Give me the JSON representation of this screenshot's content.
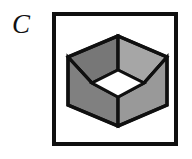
{
  "figure": {
    "label": "C",
    "caption_position": "left-of-frame",
    "frame": {
      "x": 52,
      "y": 12,
      "width": 126,
      "height": 134,
      "border_width": 4,
      "border_color": "#101010",
      "fill_color": "#ffffff"
    },
    "background_color": "#ffffff",
    "ink_color": "#101010"
  },
  "shape": {
    "name": "hexagonal-cube-with-square-hole",
    "description": "Isometric cube seen corner-on, forming a hexagon outline, with a square hole bored through it producing a white diamond opening at the center.",
    "outline_color": "#101010",
    "outline_width": 3,
    "hole_fill": "#ffffff",
    "vertices": {
      "top": [
        66,
        24
      ],
      "upper_left": [
        16,
        45
      ],
      "lower_left": [
        16,
        93
      ],
      "bottom": [
        66,
        114
      ],
      "lower_right": [
        115,
        93
      ],
      "upper_right": [
        115,
        45
      ]
    },
    "hole_vertices": {
      "top": [
        66,
        58
      ],
      "left": [
        40,
        71
      ],
      "bottom": [
        66,
        85
      ],
      "right": [
        92,
        71
      ]
    },
    "faces": [
      {
        "name": "top-left-facet",
        "color": "#777777"
      },
      {
        "name": "top-right-facet",
        "color": "#a6a6a6"
      },
      {
        "name": "left-facet",
        "color": "#808080"
      },
      {
        "name": "right-facet",
        "color": "#999999"
      },
      {
        "name": "hole-opening",
        "color": "#ffffff"
      }
    ],
    "internal_edges": [
      {
        "name": "edge-hole-top-to-cube-top",
        "from": [
          66,
          58
        ],
        "to": [
          66,
          24
        ]
      },
      {
        "name": "edge-hole-left-to-cube-left",
        "from": [
          40,
          71
        ],
        "to": [
          16,
          45
        ]
      },
      {
        "name": "edge-hole-right-to-cube-right",
        "from": [
          92,
          71
        ],
        "to": [
          115,
          45
        ]
      },
      {
        "name": "edge-hole-bottom-to-cube-bottom",
        "from": [
          66,
          85
        ],
        "to": [
          66,
          114
        ]
      }
    ]
  }
}
